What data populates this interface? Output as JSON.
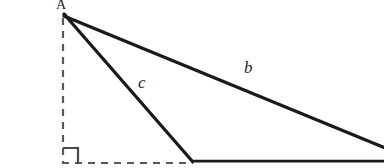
{
  "figure": {
    "kind": "geometry-diagram",
    "background_color": "#ffffff",
    "width": 384,
    "height": 168
  },
  "labels": {
    "vertex_a": "A",
    "side_b": "b",
    "side_c": "c"
  },
  "colors": {
    "stroke_solid": "#1a1a1a",
    "stroke_dashed": "#585858",
    "right_angle_mark": "#4a4a4a",
    "label_text": "#282828"
  },
  "geometry": {
    "apex": {
      "x": 64,
      "y": 14
    },
    "foot_of_altitude": {
      "x": 63,
      "y": 163
    },
    "base_left_vertex": {
      "x": 192,
      "y": 161
    },
    "base_right_edge": {
      "x": 384,
      "y": 161
    },
    "side_b_end": {
      "x": 384,
      "y": 148
    },
    "segments": [
      {
        "name": "side-b",
        "style": "solid",
        "from": [
          64,
          17
        ],
        "to": [
          384,
          148
        ],
        "stroke_width": 3.2
      },
      {
        "name": "side-c",
        "style": "solid",
        "from": [
          64,
          14
        ],
        "to": [
          192,
          161
        ],
        "stroke_width": 3.2
      },
      {
        "name": "base-solid",
        "style": "solid",
        "from": [
          192,
          161
        ],
        "to": [
          384,
          161
        ],
        "stroke_width": 2.6
      },
      {
        "name": "altitude-dashed",
        "style": "dashed",
        "from": [
          63,
          18
        ],
        "to": [
          63,
          163
        ],
        "stroke_width": 2.2
      },
      {
        "name": "base-extension-dashed",
        "style": "dashed",
        "from": [
          62,
          163
        ],
        "to": [
          193,
          163
        ],
        "stroke_width": 2.2
      }
    ],
    "right_angle_mark": {
      "corner": [
        63,
        163
      ],
      "size": 15,
      "orientation": "bottom-left"
    },
    "dash_pattern": "7 6"
  }
}
